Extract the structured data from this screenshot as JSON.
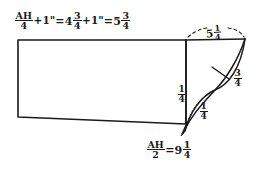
{
  "drawing": {
    "title": "Hand-drawn dimensioned panel sketch",
    "ink_color": "#1a1a1a",
    "background_color": "#ffffff"
  },
  "labels": {
    "top_equation": {
      "name": "top-height-equation",
      "lead_symbol": "AH",
      "lead_numerator": "AH",
      "lead_denominator": "4",
      "plus_term": "+1\"",
      "equals_1": "=",
      "value_1_whole": "4",
      "value_1_num": "3",
      "value_1_den": "4",
      "plus_term_2": "+1\"",
      "equals_2": "=",
      "result_whole": "5",
      "result_num": "3",
      "result_den": "4",
      "plain_text": "AH/4 + 1\" = 4 3/4 + 1\" = 5 3/4"
    },
    "bottom_equation": {
      "name": "bottom-width-equation",
      "lead_numerator": "AH",
      "lead_denominator": "2",
      "equals": "=",
      "result_whole": "9",
      "result_num": "1",
      "result_den": "4",
      "plain_text": "AH/2 = 9 1/4"
    },
    "top_span": {
      "name": "top-span-dimension",
      "whole": "5",
      "num": "1",
      "den": "4",
      "plain_text": "5 1/4"
    },
    "right_offset": {
      "name": "right-offset-dimension",
      "whole": "",
      "num": "3",
      "den": "4",
      "plain_text": "3/4"
    },
    "vertical_offset": {
      "name": "vertical-offset-dimension",
      "whole": "",
      "num": "1",
      "den": "4",
      "plain_text": "1/4"
    },
    "diagonal_offset": {
      "name": "diagonal-offset-dimension",
      "whole": "",
      "num": "1",
      "den": "4",
      "plain_text": "1/4"
    }
  },
  "geometry": {
    "main_panel": {
      "name": "main-panel-outline",
      "points": "18,40 186,40 186,124 18,117"
    },
    "top_edge_extension": {
      "name": "top-edge-extension",
      "points": "186,40 245,39"
    },
    "division_line": {
      "name": "vertical-division-line",
      "points": "186,40 186,124"
    },
    "taper_outer_arc": {
      "name": "taper-outer-arc",
      "path": "M245,39 C236,62 224,80 214,90 C204,101 192,115 184,131"
    },
    "taper_inner_arc": {
      "name": "taper-inner-arc",
      "path": "M245,39 C240,66 228,84 214,90 C200,97 190,112 184,131"
    },
    "taper_tick": {
      "name": "taper-cross-tick",
      "points": "213,68 228,78"
    },
    "arrow_tip": {
      "name": "arrow-pointer",
      "points": "186,124 183,134"
    },
    "dashed_span_arc": {
      "name": "dashed-span-arc",
      "path": "M188,37 C198,29 232,29 244,37"
    },
    "dotted_guide": {
      "name": "dotted-guide-line",
      "path": "M187,124 C192,107 203,96 213,90"
    }
  }
}
